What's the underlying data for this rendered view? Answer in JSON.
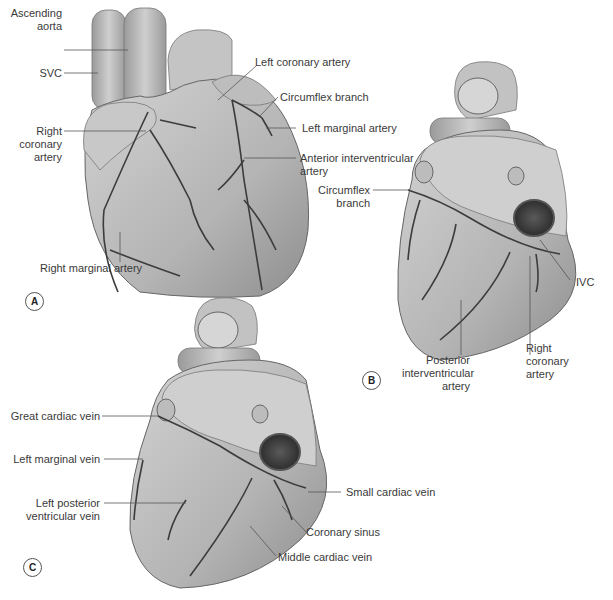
{
  "figure": {
    "panels": [
      {
        "id": "A",
        "badge": "A",
        "view": "anterior",
        "labels": {
          "ascending_aorta": [
            "Ascending",
            "aorta"
          ],
          "svc": "SVC",
          "right_coronary_artery": [
            "Right",
            "coronary",
            "artery"
          ],
          "left_coronary_artery": "Left coronary artery",
          "circumflex_branch": "Circumflex branch",
          "left_marginal_artery": "Left marginal artery",
          "anterior_interventricular_artery": [
            "Anterior interventricular",
            "artery"
          ],
          "right_marginal_artery": "Right marginal artery"
        }
      },
      {
        "id": "B",
        "badge": "B",
        "view": "posterior",
        "labels": {
          "circumflex_branch": [
            "Circumflex",
            "branch"
          ],
          "ivc": "IVC",
          "posterior_interventricular_artery": [
            "Posterior",
            "interventricular",
            "artery"
          ],
          "right_coronary_artery": [
            "Right",
            "coronary",
            "artery"
          ]
        }
      },
      {
        "id": "C",
        "badge": "C",
        "view": "posterior-veins",
        "labels": {
          "great_cardiac_vein": "Great cardiac vein",
          "left_marginal_vein": "Left marginal vein",
          "left_posterior_ventricular_vein": [
            "Left posterior",
            "ventricular vein"
          ],
          "small_cardiac_vein": "Small cardiac vein",
          "coronary_sinus": "Coronary sinus",
          "middle_cardiac_vein": "Middle cardiac vein"
        }
      }
    ],
    "colors": {
      "heart_fill": "#b8b8b8",
      "heart_light": "#d6d6d6",
      "vessel": "#3c3c3c",
      "leader": "#555555",
      "background": "#ffffff"
    }
  }
}
